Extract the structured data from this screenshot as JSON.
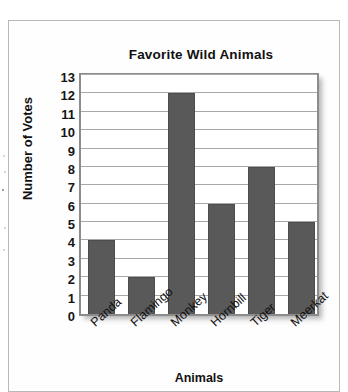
{
  "chart_data": {
    "type": "bar",
    "title": "Favorite Wild Animals",
    "xlabel": "Animals",
    "ylabel": "Number of Votes",
    "categories": [
      "Panda",
      "Flamingo",
      "Monkey",
      "Hornbill",
      "Tiger",
      "Meerkat"
    ],
    "values": [
      4,
      2,
      12,
      6,
      8,
      5
    ],
    "ylim": [
      0,
      13
    ],
    "ytick_labels": [
      "13",
      "12",
      "11",
      "10",
      "9",
      "8",
      "7",
      "6",
      "5",
      "4",
      "3",
      "2",
      "1",
      "0"
    ],
    "ytick_values": [
      13,
      12,
      11,
      10,
      9,
      8,
      7,
      6,
      5,
      4,
      3,
      2,
      1,
      0
    ],
    "grid": true,
    "legend": false,
    "bar_color": "#595959",
    "grid_color": "#a8a8a8",
    "frame_color": "#8c8c8c",
    "xtick_rotation": -42
  }
}
